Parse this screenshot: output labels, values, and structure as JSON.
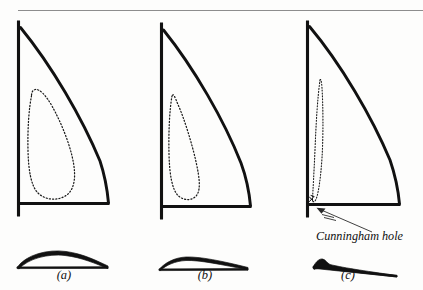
{
  "figure": {
    "background_color": "#fdfdfc",
    "ink_color": "#111111",
    "rule_color": "#8d8d8d"
  },
  "top_rule": {
    "name": "header-rule",
    "x1": 18,
    "y1": 10.5,
    "x2": 423,
    "y2": 10.5
  },
  "panels": [
    {
      "id": "a",
      "label": "(a)",
      "label_x": 64,
      "label_y": 279,
      "camber": "full",
      "draft_position": "mid-chord",
      "mast": {
        "x": 18.5,
        "y_top": 20.5,
        "y_bottom": 216.5
      },
      "boom": {
        "y": 203.5,
        "x_left": 18.5,
        "x_right": 109.5
      },
      "head": {
        "x": 20.5,
        "y": 27.5
      },
      "clew": {
        "x": 108.5,
        "y": 203.0
      },
      "leech_path": "M 20.5 27.5 C 52 66, 82 118, 100 161 C 105 176, 107.5 192, 108.5 203",
      "camber_path": "M 31.5 96 C 29 108, 27.5 128, 28 150 C 28.4 170, 31 186, 38 193 C 46 201, 60 201, 68 194 C 73.5 189, 75 180, 74.5 172 C 73.5 152, 62 124, 52 106 C 46 95.5, 40 89, 35.5 89.5 C 32.5 90, 31.5 92.5, 31.5 96 Z",
      "section": {
        "label": "section-a",
        "description": "deep camber, draft near mid-chord",
        "path": "M 17 267.5 C 26 254.5, 48 249, 66 251.5 C 84 254, 97 261, 108 266 L 108 268.6 C 96 263.8, 82 257.5, 65 255.5 C 48 253.5, 28 258.5, 19 269 Z",
        "chord": "M 17 267.6 L 108 267.4"
      }
    },
    {
      "id": "b",
      "label": "(b)",
      "label_x": 205,
      "label_y": 279,
      "camber": "reduced",
      "draft_position": "forward",
      "mast": {
        "x": 161.5,
        "y_top": 22.5,
        "y_bottom": 219.5
      },
      "boom": {
        "y": 206.5,
        "x_left": 161.5,
        "x_right": 251.5
      },
      "head": {
        "x": 163.5,
        "y": 30.0
      },
      "clew": {
        "x": 250.5,
        "y": 206.0
      },
      "leech_path": "M 163.5 30 C 194 68, 224 120, 241 163 C 246.5 178, 249.5 195, 250.5 206",
      "camber_path": "M 172 96 C 169.5 110, 168.5 132, 169 154 C 169.5 174, 172 190, 178.5 196 C 185 201.5, 194 200.5, 197.5 194 C 200.5 188, 199.5 178, 196.5 164 C 192 143, 184 118, 178 104.5 C 175 97.5, 173.5 92.5, 172 96 Z",
      "section": {
        "label": "section-b",
        "description": "flatter camber, draft moved forward",
        "path": "M 159 269.5 C 165 262.5, 175 257.5, 186 257 C 200 256.5, 222 261, 248 267.5 L 248 269.8 C 222 264.8, 200 260, 186 260.5 C 175 261, 165.5 265.5, 160.5 270.5 Z",
        "chord": "M 159 269.6 L 248 269.2"
      }
    },
    {
      "id": "c",
      "label": "(c)",
      "label_x": 348,
      "label_y": 279,
      "camber": "flat",
      "draft_position": "hard forward at luff",
      "mast": {
        "x": 307.5,
        "y_top": 20.5,
        "y_bottom": 217.5
      },
      "boom": {
        "y": 204.5,
        "x_left": 307.5,
        "x_right": 400.5
      },
      "head": {
        "x": 309.5,
        "y": 26.5
      },
      "clew": {
        "x": 399.5,
        "y": 204.0
      },
      "leech_path": "M 309.5 26.5 C 341 64, 372 117, 390 160 C 395.5 176, 398.5 193, 399.5 204",
      "camber_path": "M 320 80 C 317.5 98, 316 124, 315 150 C 314 172, 313 190, 312.5 199 C 312.3 202, 313.5 202.5, 315 201 C 318 197.5, 320.5 180, 322 158 C 323.5 133, 323 104, 322 88 C 321.6 82, 320.8 78, 320 80 Z",
      "section": {
        "label": "section-c",
        "description": "nearly flat, small bump at the luff",
        "path": "M 313 267 C 316 261.5, 319.5 258.5, 322.5 259 C 325.5 259.5, 327 263, 330 264.5 C 344 268, 372 272, 397 275.5 L 397 277 C 370 274, 342 271, 327 269 C 320 268, 316 268.5, 314 269.5 Z",
        "chord": "M 313 267.5 L 397 276.2"
      }
    }
  ],
  "annotation": {
    "name": "cunningham-hole-annotation",
    "text": "Cunningham hole",
    "text_x": 316,
    "text_y": 240,
    "pointer": {
      "from_x": 372,
      "from_y": 232,
      "to_x": 317,
      "to_y": 209
    },
    "hole_mark": {
      "x": 311,
      "y": 199.5,
      "description": "small eyelet mark at the luff just above the tack"
    }
  }
}
